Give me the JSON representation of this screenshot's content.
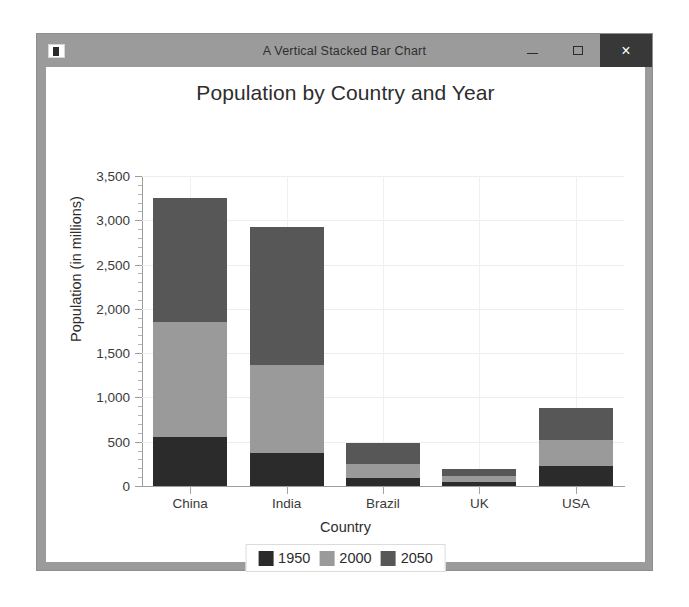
{
  "window": {
    "title": "A Vertical Stacked Bar Chart",
    "app_icon": "app-window-icon",
    "minimize_label": "–",
    "maximize_label": "□",
    "close_label": "×",
    "chrome_color": "#9b9b9b",
    "close_button_color": "#383838"
  },
  "chart_data": {
    "type": "bar",
    "stacked": true,
    "orientation": "vertical",
    "title": "Population by Country and Year",
    "xlabel": "Country",
    "ylabel": "Population (in millions)",
    "categories": [
      "China",
      "India",
      "Brazil",
      "UK",
      "USA"
    ],
    "series": [
      {
        "name": "1950",
        "color": "#2b2b2b",
        "values": [
          554,
          370,
          90,
          50,
          225
        ]
      },
      {
        "name": "2000",
        "color": "#9a9a9a",
        "values": [
          1296,
          1000,
          160,
          60,
          295
        ]
      },
      {
        "name": "2050",
        "color": "#575757",
        "values": [
          1400,
          1550,
          235,
          80,
          360
        ]
      }
    ],
    "totals": [
      3250,
      2920,
      485,
      190,
      880
    ],
    "ylim": [
      0,
      3500
    ],
    "ytick_labels": [
      "0",
      "500",
      "1,000",
      "1,500",
      "2,000",
      "2,500",
      "3,000",
      "3,500"
    ],
    "ytick_values": [
      0,
      500,
      1000,
      1500,
      2000,
      2500,
      3000,
      3500
    ],
    "yminor_step": 100,
    "grid": true,
    "legend_position": "bottom",
    "legend_entries": [
      "1950",
      "2000",
      "2050"
    ]
  }
}
